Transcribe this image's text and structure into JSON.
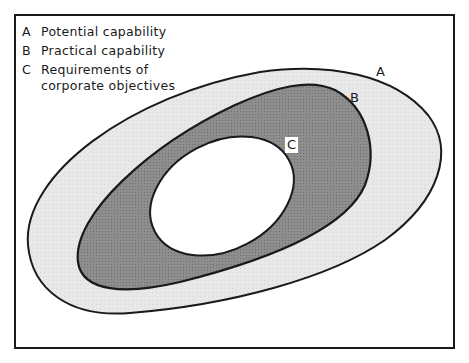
{
  "legend": [
    {
      "key": "A",
      "text": "Potential capability"
    },
    {
      "key": "B",
      "text": "Practical capability"
    },
    {
      "key": "C",
      "text": "Requirements of\ncorporate objectives"
    }
  ],
  "labels": {
    "a": "A",
    "b": "B",
    "c": "C"
  },
  "colors": {
    "outer_fill": "#e6e6e6",
    "middle_fill": "#8c8c8c",
    "inner_fill": "#ffffff",
    "stroke": "#1a1a1a"
  }
}
